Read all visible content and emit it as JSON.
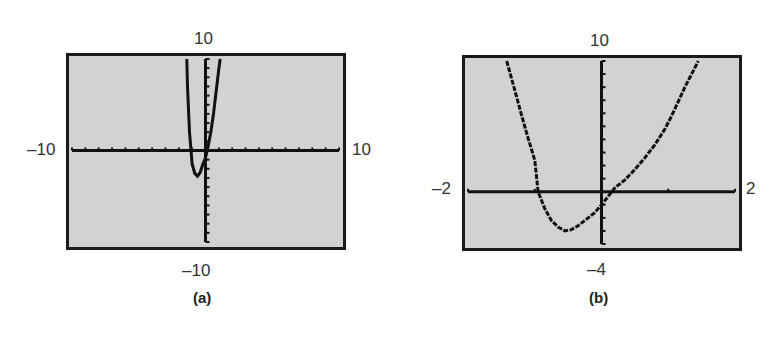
{
  "chart_data": [
    {
      "type": "line",
      "caption": "(a)",
      "title": "",
      "xlabel": "",
      "ylabel": "",
      "window": {
        "xmin": -10,
        "xmax": 10,
        "ymin": -10,
        "ymax": 10,
        "xscl": 1,
        "yscl": 1
      },
      "labels": {
        "top": "10",
        "bottom": "-10",
        "left": "-10",
        "right": "10"
      },
      "grid": false,
      "series": [
        {
          "name": "graph-a",
          "x": [
            -1.4,
            -1.35,
            -1.2,
            -1.0,
            -0.8,
            -0.6,
            -0.4,
            -0.2,
            0.0,
            0.2,
            0.4,
            0.6,
            0.8,
            1.0,
            1.1
          ],
          "y": [
            10,
            7,
            2,
            -1.5,
            -2.5,
            -2.8,
            -2.4,
            -1.5,
            -0.8,
            0.5,
            2,
            4,
            6.5,
            9,
            10
          ]
        }
      ]
    },
    {
      "type": "line",
      "caption": "(b)",
      "title": "",
      "xlabel": "",
      "ylabel": "",
      "window": {
        "xmin": -2,
        "xmax": 2,
        "ymin": -4,
        "ymax": 10,
        "xscl": 1,
        "yscl": 1
      },
      "labels": {
        "top": "10",
        "bottom": "-4",
        "left": "-2",
        "right": "2"
      },
      "grid": false,
      "series": [
        {
          "name": "graph-b",
          "x": [
            -1.42,
            -1.3,
            -1.2,
            -1.1,
            -1.0,
            -0.95,
            -0.85,
            -0.75,
            -0.65,
            -0.55,
            -0.45,
            -0.35,
            -0.2,
            -0.1,
            0.0,
            0.1,
            0.2,
            0.35,
            0.5,
            0.65,
            0.8,
            0.95,
            1.05,
            1.15,
            1.25,
            1.35,
            1.45
          ],
          "y": [
            10,
            7.8,
            5.9,
            4.1,
            2.4,
            0,
            -1.3,
            -2.2,
            -2.7,
            -3.0,
            -2.9,
            -2.6,
            -2.0,
            -1.6,
            -1.0,
            -0.35,
            0.3,
            0.9,
            1.7,
            2.6,
            3.6,
            4.8,
            5.8,
            6.9,
            8.0,
            9.0,
            10
          ]
        }
      ]
    }
  ]
}
